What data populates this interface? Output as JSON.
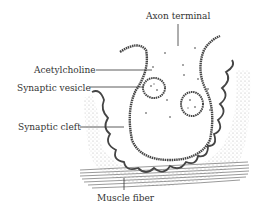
{
  "diagram": {
    "labels": {
      "axon_terminal": "Axon terminal",
      "acetylcholine": "Acetylcholine",
      "synaptic_vesicle": "Synaptic vesicle",
      "synaptic_cleft": "Synaptic cleft",
      "muscle_fiber": "Muscle fiber"
    },
    "colors": {
      "ink": "#333333",
      "stipple": "#9a9a9a",
      "dots": "#8a8a8a",
      "background": "#ffffff"
    }
  }
}
